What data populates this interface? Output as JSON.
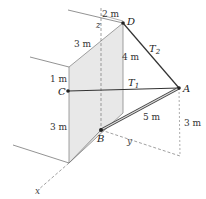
{
  "diagram": {
    "type": "3d-statics-boom-cables",
    "points": {
      "A": "A",
      "B": "B",
      "C": "C",
      "D": "D"
    },
    "cables": {
      "T1": "T",
      "T1_sub": "1",
      "T2": "T",
      "T2_sub": "2"
    },
    "axes": {
      "x": "x",
      "y": "y",
      "z": "z"
    },
    "dimensions": {
      "top_2m": "2 m",
      "wall_top_3m": "3 m",
      "wall_1m": "1 m",
      "wall_bottom_3m": "3 m",
      "vertical_4m": "4 m",
      "boom_5m": "5 m",
      "right_3m": "3 m"
    },
    "colors": {
      "wall_fill": "#e6e6e6",
      "line": "#555555",
      "cable": "#333333",
      "dash": "#777777"
    }
  }
}
